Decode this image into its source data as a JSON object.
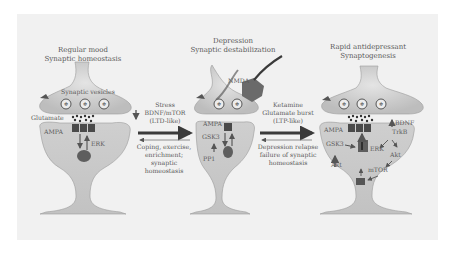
{
  "figure": {
    "panels": [
      {
        "id": "regular",
        "title_line1": "Regular mood",
        "title_line2": "Synaptic homeostasis",
        "labels": {
          "vesicles": "Synaptic vesicles",
          "glutamate": "Glutamate",
          "ampa": "AMPA",
          "erk": "ERK"
        }
      },
      {
        "id": "depression",
        "title_line1": "Depression",
        "title_line2": "Synaptic destabilization",
        "labels": {
          "nmda": "NMDA",
          "ampa": "AMPA",
          "gsk3": "GSK3",
          "pp1": "PP1"
        }
      },
      {
        "id": "rapid",
        "title_line1": "Rapid antidepressant",
        "title_line2": "Synaptogenesis",
        "labels": {
          "ampa": "AMPA",
          "gsk3": "GSK3",
          "akt_left": "Akt",
          "erk": "ERK",
          "akt_right": "Akt",
          "bdnf": "BDNF",
          "trkb": "TrkB",
          "mtor": "mTOR"
        }
      }
    ],
    "transitions": [
      {
        "id": "stress",
        "forward_line1": "Stress",
        "forward_line2": "BDNF/mTOR",
        "forward_line3": "(LTD-like)",
        "backward_line1": "Coping, exercise,",
        "backward_line2": "enrichment;",
        "backward_line3": "synaptic",
        "backward_line4": "homeostasis"
      },
      {
        "id": "ketamine",
        "forward_line1": "Ketamine",
        "forward_line2": "Glutamate burst",
        "forward_line3": "(LTP-like)",
        "backward_line1": "Depression relapse",
        "backward_line2": "failure of synaptic",
        "backward_line3": "homeostasis"
      }
    ],
    "colors": {
      "panel_bg": "#f1f1f1",
      "spine_fill": "#c8c8c8",
      "terminal_fill": "#d4d4d4",
      "receptor_dark": "#4a4a4a",
      "text": "#5a5a5a"
    }
  }
}
